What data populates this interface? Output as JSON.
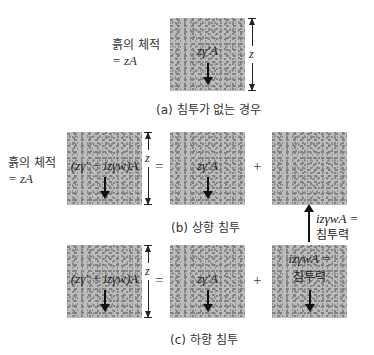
{
  "figure": {
    "side_label": {
      "line1": "흙의 체적",
      "line2": "= zA"
    },
    "dimension_label": "z",
    "panel_a": {
      "caption": "(a) 침투가 없는 경우",
      "box_label": "zγ′A"
    },
    "panel_b": {
      "caption": "(b) 상향 침투",
      "box1_label": "(zγ′ − izγw)A",
      "box2_label": "zγ′A",
      "equals": "=",
      "plus": "+",
      "seepage_label_line1": "izγwA =",
      "seepage_label_line2": "침투력"
    },
    "panel_c": {
      "caption": "(c) 하향 침투",
      "box1_label": "(zγ′ + izγw)A",
      "box2_label": "zγ′A",
      "equals": "=",
      "plus": "+",
      "seepage_label_line1": "izγwA =",
      "seepage_label_line2": "침투력"
    },
    "colors": {
      "soil": "#bcbcbc",
      "speckle": "#858585",
      "arrow": "#111111"
    }
  }
}
